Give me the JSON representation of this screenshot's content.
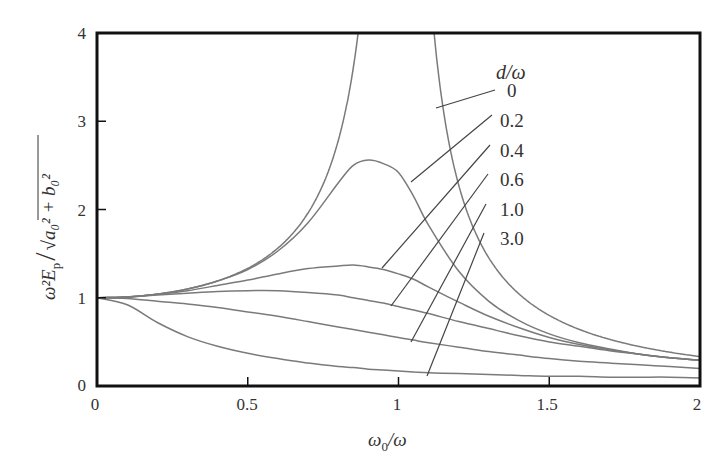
{
  "chart_data": {
    "type": "line",
    "title": "",
    "xlabel": "ω0/ω",
    "ylabel": "ω²E_p / √(a0² + b0²)",
    "xlim": [
      0,
      2
    ],
    "ylim": [
      0,
      4
    ],
    "x_ticks": [
      "0",
      "0.5",
      "1",
      "1.5",
      "2"
    ],
    "y_ticks": [
      "0",
      "1",
      "2",
      "3",
      "4"
    ],
    "grid": false,
    "legend": {
      "title": "d/ω",
      "position": "upper right, inline labels with leader lines",
      "entries": [
        "0",
        "0.2",
        "0.4",
        "0.6",
        "1.0",
        "3.0"
      ]
    },
    "x": [
      0,
      0.1,
      0.2,
      0.3,
      0.4,
      0.5,
      0.6,
      0.7,
      0.8,
      0.85,
      0.9,
      0.95,
      1.0,
      1.05,
      1.1,
      1.2,
      1.3,
      1.4,
      1.5,
      1.6,
      1.7,
      1.8,
      1.9,
      2.0
    ],
    "series": [
      {
        "name": "0",
        "values": [
          1.0,
          1.01,
          1.04,
          1.1,
          1.19,
          1.33,
          1.56,
          1.96,
          2.78,
          3.6,
          5.26,
          null,
          null,
          null,
          4.76,
          2.27,
          1.45,
          1.04,
          0.8,
          0.64,
          0.53,
          0.45,
          0.38,
          0.33
        ]
      },
      {
        "name": "0.2",
        "values": [
          1.0,
          1.01,
          1.04,
          1.1,
          1.19,
          1.32,
          1.53,
          1.85,
          2.3,
          2.5,
          2.56,
          2.52,
          2.42,
          2.15,
          1.82,
          1.3,
          0.96,
          0.74,
          0.59,
          0.49,
          0.42,
          0.36,
          0.32,
          0.29
        ]
      },
      {
        "name": "0.4",
        "values": [
          1.0,
          1.01,
          1.04,
          1.08,
          1.14,
          1.2,
          1.27,
          1.33,
          1.36,
          1.37,
          1.35,
          1.32,
          1.27,
          1.21,
          1.12,
          0.95,
          0.79,
          0.66,
          0.55,
          0.47,
          0.41,
          0.36,
          0.32,
          0.29
        ]
      },
      {
        "name": "0.6",
        "values": [
          1.0,
          1.01,
          1.03,
          1.05,
          1.07,
          1.08,
          1.08,
          1.06,
          1.03,
          1.0,
          0.97,
          0.94,
          0.9,
          0.86,
          0.82,
          0.73,
          0.65,
          0.57,
          0.5,
          0.45,
          0.4,
          0.36,
          0.32,
          0.29
        ]
      },
      {
        "name": "1.0",
        "values": [
          1.0,
          0.99,
          0.96,
          0.93,
          0.89,
          0.84,
          0.79,
          0.73,
          0.67,
          0.64,
          0.61,
          0.58,
          0.55,
          0.52,
          0.49,
          0.44,
          0.39,
          0.35,
          0.31,
          0.28,
          0.26,
          0.24,
          0.22,
          0.2
        ]
      },
      {
        "name": "3.0",
        "values": [
          1.0,
          0.92,
          0.72,
          0.56,
          0.45,
          0.37,
          0.31,
          0.26,
          0.22,
          0.21,
          0.19,
          0.18,
          0.17,
          0.16,
          0.15,
          0.14,
          0.13,
          0.12,
          0.11,
          0.11,
          0.1,
          0.1,
          0.1,
          0.09
        ]
      }
    ]
  },
  "axes": {
    "x_title_main": "ω",
    "x_title_sub": "0",
    "x_title_rest": "/ω",
    "y_title": "ω²E",
    "y_title_sub": "p",
    "y_title_rest": "√a₀² + b₀²"
  },
  "legend": {
    "title": "d/ω",
    "labels": [
      "0",
      "0.2",
      "0.4",
      "0.6",
      "1.0",
      "3.0"
    ]
  },
  "colors": {
    "curve": "#7a7a7a",
    "frame": "#111111",
    "text": "#333333"
  }
}
